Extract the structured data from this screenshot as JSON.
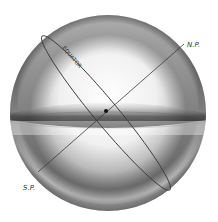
{
  "diagram": {
    "type": "celestial-sphere",
    "labels": {
      "equator": "EQUATOR",
      "north_pole": "N.P.",
      "south_pole": "S.P."
    },
    "colors": {
      "background": "#ffffff",
      "line": "#3a3a3a",
      "sphere_light": "#f4f4f4",
      "sphere_dark": "#555555"
    },
    "geometry": {
      "sphere_center": [
        108,
        113
      ],
      "sphere_radius": 98,
      "axis_from": [
        38,
        172
      ],
      "axis_to": [
        184,
        44
      ],
      "equator_point_a": [
        42,
        36
      ],
      "equator_point_b": [
        170,
        190
      ],
      "center_dot": [
        106,
        111
      ]
    }
  }
}
